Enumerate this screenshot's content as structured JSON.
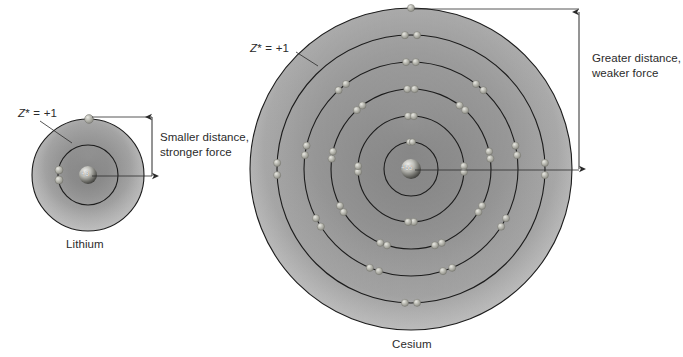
{
  "figure": {
    "title_alt": "Comparison of effective nuclear charge and atomic radius in lithium and cesium",
    "background_color": "#ffffff",
    "ink_color": "#231f20",
    "shell_stroke_color": "#1a1a1a",
    "cloud_light_color": "#e8e8e8",
    "cloud_dark_color": "#8d8d8d",
    "electron_color": "#a9a9a2"
  },
  "atoms": [
    {
      "id": "lithium",
      "caption": "Lithium",
      "nucleus_charge_label": "+3",
      "effective_charge_label_z": "Z",
      "effective_charge_label_star": "*",
      "effective_charge_label_value": " = +1",
      "center_x": 88,
      "center_y": 175,
      "cloud_radius": 56,
      "shells": [
        {
          "index": 1,
          "radius": 30,
          "electron_count": 2
        },
        {
          "index": 2,
          "radius": 56,
          "electron_count": 1
        }
      ],
      "nucleus_radius": 9
    },
    {
      "id": "cesium",
      "caption": "Cesium",
      "nucleus_charge_label": "+55",
      "effective_charge_label_z": "Z",
      "effective_charge_label_star": "*",
      "effective_charge_label_value": " = +1",
      "center_x": 411,
      "center_y": 169,
      "cloud_radius": 161,
      "shells": [
        {
          "index": 1,
          "radius": 27,
          "electron_count": 2
        },
        {
          "index": 2,
          "radius": 53,
          "electron_count": 8
        },
        {
          "index": 3,
          "radius": 80,
          "electron_count": 18
        },
        {
          "index": 4,
          "radius": 107,
          "electron_count": 18
        },
        {
          "index": 5,
          "radius": 134,
          "electron_count": 8
        },
        {
          "index": 6,
          "radius": 161,
          "electron_count": 1
        }
      ],
      "nucleus_radius": 10
    }
  ],
  "annotations": [
    {
      "id": "smaller-distance",
      "line1": "Smaller distance,",
      "line2": "stronger force",
      "dimension_x": 152,
      "dimension_top_y": 116,
      "dimension_bottom_y": 176
    },
    {
      "id": "greater-distance",
      "line1": "Greater distance,",
      "line2": "weaker force",
      "dimension_x": 579,
      "dimension_top_y": 13,
      "dimension_bottom_y": 170
    }
  ]
}
